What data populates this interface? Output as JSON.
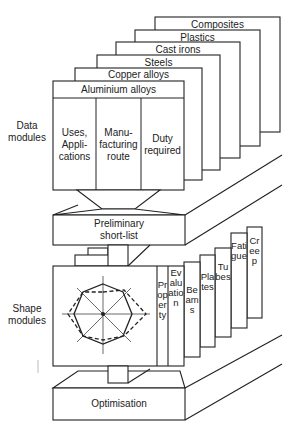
{
  "side_labels": {
    "data_modules": "Data\nmodules",
    "shape_modules": "Shape\nmodules"
  },
  "data_modules": {
    "material_cards": [
      {
        "label": "Composites"
      },
      {
        "label": "Plastics"
      },
      {
        "label": "Cast irons"
      },
      {
        "label": "Steels"
      },
      {
        "label": "Copper alloys"
      },
      {
        "label": "Aluminium alloys"
      }
    ],
    "columns": [
      {
        "label": "Uses,\nAppli-\ncations"
      },
      {
        "label": "Manu-\nfacturing\nroute"
      },
      {
        "label": "Duty\nrequired"
      }
    ]
  },
  "stages": {
    "preliminary": "Preliminary\nshort-list",
    "optimisation": "Optimisation"
  },
  "shape_modules": {
    "cards": [
      {
        "label": "Property"
      },
      {
        "label": "Evaluation"
      },
      {
        "label": "Beams"
      },
      {
        "label": "Plates"
      },
      {
        "label": "Tubes"
      },
      {
        "label": "Fatigue"
      },
      {
        "label": "Creep"
      }
    ],
    "radar_chart": {
      "axes": 8,
      "series": [
        {
          "name": "solid",
          "style": "solid"
        },
        {
          "name": "dashed",
          "style": "dashed"
        }
      ]
    }
  },
  "colors": {
    "line": "#222222",
    "background": "#ffffff"
  }
}
